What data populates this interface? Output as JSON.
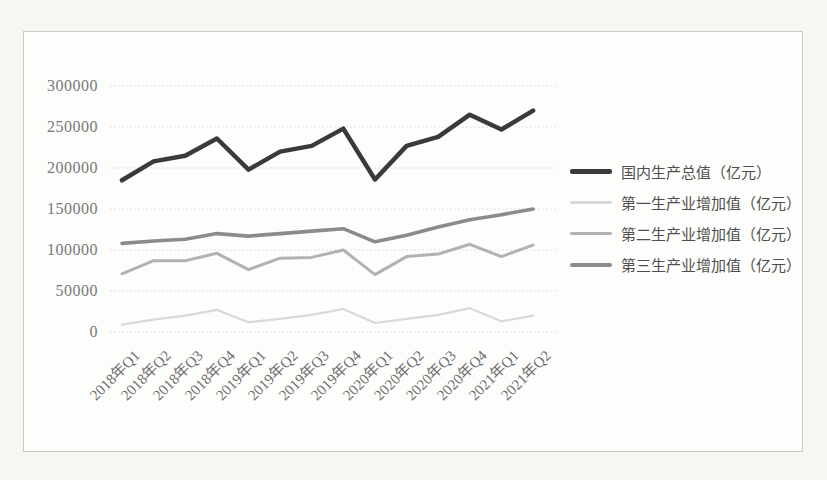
{
  "chart_data": {
    "type": "line",
    "title": "",
    "xlabel": "",
    "ylabel": "",
    "unit": "亿元",
    "categories": [
      "2018年Q1",
      "2018年Q2",
      "2018年Q3",
      "2018年Q4",
      "2019年Q1",
      "2019年Q2",
      "2019年Q3",
      "2019年Q4",
      "2020年Q1",
      "2020年Q2",
      "2020年Q3",
      "2020年Q4",
      "2021年Q1",
      "2021年Q2"
    ],
    "series": [
      {
        "name": "国内生产总值（亿元）",
        "color": "#3a3a3a",
        "stroke_width": 4.5,
        "values": [
          185000,
          208000,
          215000,
          236000,
          198000,
          220000,
          227000,
          248000,
          186000,
          227000,
          238000,
          265000,
          247000,
          270000
        ]
      },
      {
        "name": "第一生产业增加值（亿元）",
        "color": "#d9d9d7",
        "stroke_width": 2.2,
        "values": [
          9000,
          15000,
          20000,
          27000,
          12000,
          16000,
          21000,
          28000,
          11000,
          16000,
          21000,
          29000,
          13000,
          20000
        ]
      },
      {
        "name": "第二生产业增加值（亿元）",
        "color": "#b2b2b0",
        "stroke_width": 3.0,
        "values": [
          71000,
          87000,
          87000,
          96000,
          76000,
          90000,
          91000,
          100000,
          70000,
          92000,
          95000,
          107000,
          92000,
          106000
        ]
      },
      {
        "name": "第三生产业增加值（亿元）",
        "color": "#8b8b89",
        "stroke_width": 3.6,
        "values": [
          108000,
          111000,
          113000,
          120000,
          117000,
          120000,
          123000,
          126000,
          110000,
          118000,
          128000,
          137000,
          143000,
          150000
        ]
      }
    ],
    "yticks": [
      0,
      50000,
      100000,
      150000,
      200000,
      250000,
      300000
    ],
    "ylim": [
      0,
      300000
    ],
    "grid": "horizontal-dotted",
    "gridline_color": "#d6d6d2",
    "legend_position": "right"
  }
}
